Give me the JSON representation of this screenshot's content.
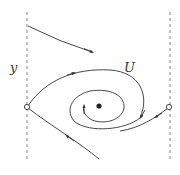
{
  "diagram": {
    "labels": {
      "left_axis": "y",
      "loop": "U"
    },
    "colors": {
      "stroke": "#333333",
      "dashed": "#888888",
      "background": "#ffffff"
    },
    "elements": [
      {
        "name": "left-boundary",
        "kind": "dashed-line"
      },
      {
        "name": "right-boundary",
        "kind": "dashed-line"
      },
      {
        "name": "left-saddle-point",
        "kind": "open-circle"
      },
      {
        "name": "right-saddle-point",
        "kind": "open-circle"
      },
      {
        "name": "center-point",
        "kind": "filled-dot"
      },
      {
        "name": "top-trajectory",
        "kind": "curve-with-arrow",
        "direction": "left-to-right"
      },
      {
        "name": "separatrix-loop-U",
        "kind": "curve-with-arrow",
        "direction": "clockwise"
      },
      {
        "name": "inner-spiral",
        "kind": "curve-with-arrow",
        "direction": "counter-clockwise"
      },
      {
        "name": "incoming-bottom-trajectory",
        "kind": "curve-with-arrow",
        "direction": "toward-left-saddle"
      },
      {
        "name": "right-saddle-outflow",
        "kind": "curve-with-arrow",
        "direction": "away-from-right-saddle"
      }
    ]
  }
}
